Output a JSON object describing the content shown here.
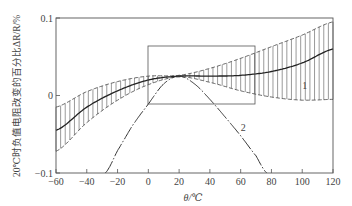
{
  "chart_data": {
    "type": "line",
    "title": "",
    "xlabel": "θ/℃",
    "ylabel": "20℃时负值电阻改变的百分比ΔR/R/%",
    "xlim": [
      -60,
      120
    ],
    "ylim": [
      -0.1,
      0.1
    ],
    "x_ticks": [
      "-60",
      "-40",
      "-20",
      "0",
      "20",
      "40",
      "60",
      "80",
      "100",
      "120"
    ],
    "y_ticks": [
      "0.1",
      "0",
      "-0.1"
    ],
    "grid": false,
    "annotations": [
      {
        "text": "1",
        "x": 100,
        "y": 0.013,
        "ref": "curve 1 (solid, with hatched tolerance band)"
      },
      {
        "text": "2",
        "x": 60,
        "y": -0.04,
        "ref": "curve 2 (dash-dot parabola)"
      },
      {
        "text": "rectangle",
        "x_range": [
          0,
          70
        ],
        "y_range": [
          -0.006,
          0.068
        ],
        "ref": "highlighted working region"
      }
    ],
    "series": [
      {
        "name": "1",
        "style": "solid",
        "x": [
          -60,
          -40,
          -20,
          0,
          20,
          40,
          60,
          80,
          100,
          120
        ],
        "values": [
          -0.045,
          -0.015,
          0.006,
          0.02,
          0.025,
          0.025,
          0.026,
          0.031,
          0.042,
          0.06
        ],
        "band_upper": [
          -0.015,
          0.005,
          0.018,
          0.025,
          0.026,
          0.035,
          0.048,
          0.063,
          0.078,
          0.095
        ],
        "band_lower": [
          -0.072,
          -0.035,
          -0.006,
          0.014,
          0.024,
          0.017,
          0.006,
          -0.002,
          -0.006,
          -0.005
        ]
      },
      {
        "name": "2",
        "style": "dash-dot",
        "x": [
          -28,
          -20,
          -10,
          0,
          10,
          20,
          30,
          40,
          50,
          60,
          70,
          77
        ],
        "values": [
          -0.1,
          -0.071,
          -0.038,
          -0.011,
          0.015,
          0.025,
          0.015,
          -0.005,
          -0.028,
          -0.052,
          -0.078,
          -0.1
        ]
      }
    ]
  }
}
